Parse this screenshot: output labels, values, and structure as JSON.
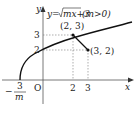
{
  "diagram": {
    "equation_prefix": "y=",
    "equation_radicand": "mx+3",
    "equation_condition": "(m>0)",
    "axis_x_label": "x",
    "axis_y_label": "y",
    "origin_label": "O",
    "x_intercept_numerator": "3",
    "x_intercept_sign": "−",
    "x_intercept_denominator": "m",
    "points": [
      {
        "label": "(2, 3)",
        "x": 2,
        "y": 3
      },
      {
        "label": "(3, 2)",
        "x": 3,
        "y": 2
      }
    ],
    "x_ticks": [
      "2",
      "3"
    ],
    "y_ticks": [
      "2",
      "3"
    ],
    "colors": {
      "stroke": "#111111",
      "guide": "#777777"
    }
  }
}
